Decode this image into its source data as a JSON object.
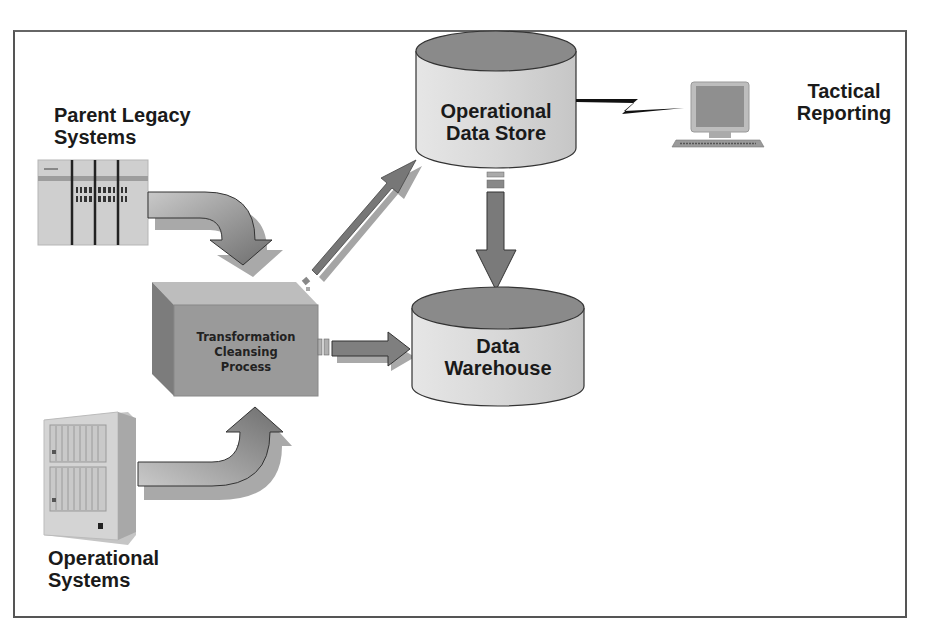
{
  "diagram": {
    "type": "data-architecture-flow",
    "nodes": {
      "parent_legacy": {
        "label_line1": "Parent Legacy",
        "label_line2": "Systems",
        "icon": "mainframe-rack-icon"
      },
      "operational_systems": {
        "label_line1": "Operational",
        "label_line2": "Systems",
        "icon": "server-cabinet-icon"
      },
      "transformation": {
        "label_line1": "Transformation",
        "label_line2": "Cleansing",
        "label_line3": "Process",
        "icon": "3d-box-icon"
      },
      "ods": {
        "label_line1": "Operational",
        "label_line2": "Data Store",
        "icon": "database-cylinder-icon"
      },
      "warehouse": {
        "label_line1": "Data",
        "label_line2": "Warehouse",
        "icon": "database-cylinder-icon"
      },
      "tactical": {
        "label_line1": "Tactical",
        "label_line2": "Reporting",
        "icon": "desktop-computer-icon"
      }
    },
    "edges": [
      {
        "from": "Parent Legacy Systems",
        "to": "Transformation Cleansing Process",
        "style": "curved-arrow"
      },
      {
        "from": "Operational Systems",
        "to": "Transformation Cleansing Process",
        "style": "curved-arrow"
      },
      {
        "from": "Transformation Cleansing Process",
        "to": "Operational Data Store",
        "style": "thin-diagonal-arrow"
      },
      {
        "from": "Transformation Cleansing Process",
        "to": "Data Warehouse",
        "style": "straight-arrow"
      },
      {
        "from": "Operational Data Store",
        "to": "Data Warehouse",
        "style": "straight-arrow"
      },
      {
        "from": "Operational Data Store",
        "to": "Tactical Reporting",
        "style": "lightning-link"
      }
    ],
    "colors": {
      "frame": "#555555",
      "cylinder_top": "#8a8a8a",
      "cylinder_body": "#d6d6d6",
      "arrow_fill": "#7a7a7a",
      "arrow_shadow": "#a8a8a8",
      "box_front": "#9a9a9a",
      "box_top": "#bdbdbd",
      "box_side": "#7c7c7c",
      "text": "#1a1a1a"
    }
  }
}
